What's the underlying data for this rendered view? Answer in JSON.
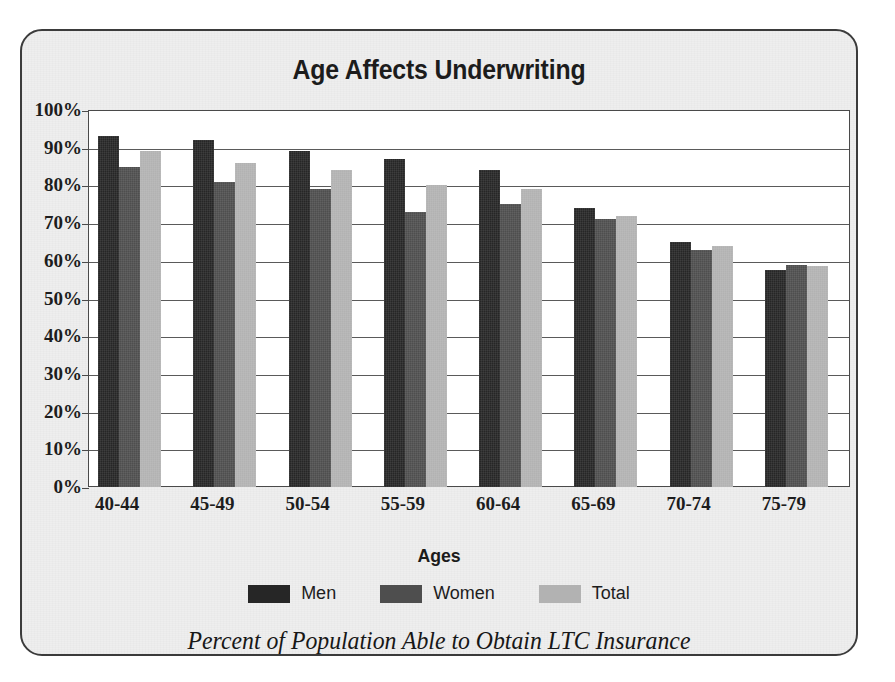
{
  "chart_data": {
    "type": "bar",
    "title": "Age Affects Underwriting",
    "caption": "Percent of Population Able to Obtain LTC Insurance",
    "xlabel": "Ages",
    "ylabel": "",
    "ylim": [
      0,
      100
    ],
    "yunit": "%",
    "grid": true,
    "legend_position": "bottom",
    "categories": [
      "40-44",
      "45-49",
      "50-54",
      "55-59",
      "60-64",
      "65-69",
      "70-74",
      "75-79"
    ],
    "ytick_labels": [
      "100%",
      "90%",
      "80%",
      "70%",
      "60%",
      "50%",
      "40%",
      "30%",
      "20%",
      "10%",
      "0%"
    ],
    "ytick_values": [
      100,
      90,
      80,
      70,
      60,
      50,
      40,
      30,
      20,
      10,
      0
    ],
    "series": [
      {
        "name": "Men",
        "color": "#262626",
        "values": [
          93,
          92,
          89,
          87,
          84,
          74,
          65,
          57.5
        ]
      },
      {
        "name": "Women",
        "color": "#4e4e4e",
        "values": [
          85,
          81,
          79,
          73,
          75,
          71,
          63,
          59
        ]
      },
      {
        "name": "Total",
        "color": "#b2b2b2",
        "values": [
          89,
          86,
          84,
          80,
          79,
          72,
          64,
          58.5
        ]
      }
    ]
  },
  "figure": {
    "background_color": "#eeeeee",
    "border_color": "#3b3b3b",
    "plot_background_color": "#ffffff"
  }
}
